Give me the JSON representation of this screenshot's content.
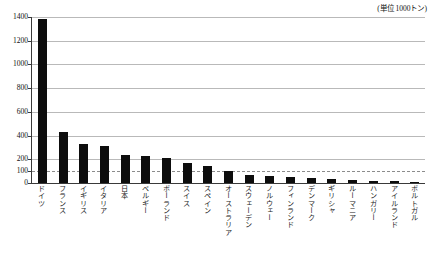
{
  "caption": {
    "unit_note": "(単位 1000トン)"
  },
  "chart_data": {
    "type": "bar",
    "title": "",
    "subtitle": "",
    "xlabel": "",
    "ylabel": "",
    "unit_note": "(単位 1000トン)",
    "ylim": [
      0,
      1400
    ],
    "yticks": [
      0,
      100,
      200,
      400,
      600,
      800,
      1000,
      1200,
      1400
    ],
    "ytick_labels": [
      "0",
      "100",
      "200",
      "400",
      "600",
      "800",
      "1000",
      "1200",
      "1400"
    ],
    "dashed_gridlines": [
      100
    ],
    "grid": true,
    "legend": null,
    "bar_color": "#0d0d0d",
    "categories": [
      "ドイツ",
      "フランス",
      "イギリス",
      "イタリア",
      "日本",
      "ベルギー",
      "ポーランド",
      "スイス",
      "スペイン",
      "オーストラリア",
      "スウェーデン",
      "ノルウェー",
      "フィンランド",
      "デンマーク",
      "ギリシャ",
      "ルーマニア",
      "ハンガリー",
      "アイルランド",
      "ポルトガル"
    ],
    "values": [
      1380,
      430,
      330,
      310,
      240,
      225,
      215,
      165,
      145,
      100,
      70,
      55,
      50,
      40,
      30,
      25,
      20,
      15,
      10
    ]
  }
}
